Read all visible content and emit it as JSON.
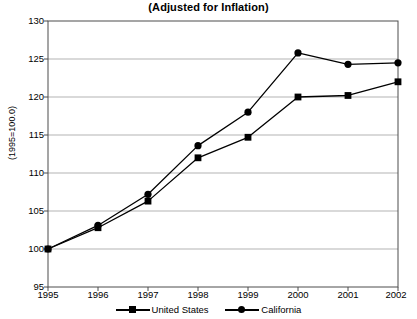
{
  "chart_data": {
    "type": "line",
    "title": "(Adjusted for Inflation)",
    "xlabel": "",
    "ylabel": "(1995=100.0)",
    "x": [
      1995,
      1996,
      1997,
      1998,
      1999,
      2000,
      2001,
      2002
    ],
    "xtick_labels": [
      "1995",
      "1996",
      "1997",
      "1998",
      "1999",
      "2000",
      "2001",
      "2002"
    ],
    "ytick_labels": [
      "95",
      "100",
      "105",
      "110",
      "115",
      "120",
      "125",
      "130"
    ],
    "ytick_values": [
      95,
      100,
      105,
      110,
      115,
      120,
      125,
      130
    ],
    "ylim": [
      95,
      130
    ],
    "xlim": [
      1995,
      2002
    ],
    "grid": "horizontal",
    "legend_position": "bottom",
    "series": [
      {
        "name": "United States",
        "marker": "square",
        "color": "#000000",
        "values": [
          100.0,
          102.8,
          106.3,
          112.0,
          114.7,
          120.0,
          120.2,
          122.0
        ]
      },
      {
        "name": "California",
        "marker": "circle",
        "color": "#000000",
        "values": [
          100.0,
          103.1,
          107.2,
          113.6,
          118.0,
          125.8,
          124.3,
          124.5
        ]
      }
    ]
  },
  "colors": {
    "gridline": "#b3b3b3",
    "axis": "#4d4d4d",
    "series": "#000000",
    "background": "#ffffff"
  }
}
